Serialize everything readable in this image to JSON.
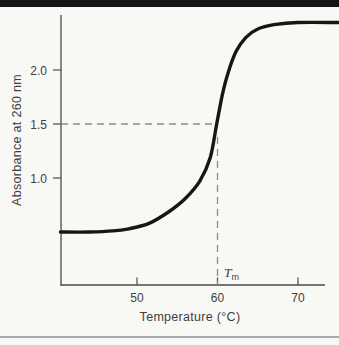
{
  "colors": {
    "background": "#f8f8f5",
    "top_bar": "#141414",
    "bottom_rule": "#a9a9a9",
    "axis": "#4a4a4a",
    "text": "#3f3f3f",
    "guide": "#8c8c8c",
    "curve": "#161616"
  },
  "labels": {
    "y_axis": "Absorbance at 260 nm",
    "x_axis": "Temperature (°C)",
    "tm_main": "T",
    "tm_sub": "m"
  },
  "chart_data": {
    "type": "line",
    "title": "",
    "xlabel": "Temperature (°C)",
    "ylabel": "Absorbance at 260 nm",
    "xlim": [
      40.5,
      73.5
    ],
    "ylim": [
      0,
      2.5
    ],
    "grid": false,
    "legend": null,
    "x_ticks": [
      50,
      60,
      70
    ],
    "x_tick_labels": [
      "50",
      "60",
      "70"
    ],
    "y_ticks": [
      1.0,
      1.5,
      2.0
    ],
    "y_tick_labels": [
      "1.0",
      "1.5",
      "2.0"
    ],
    "series": [
      {
        "name": "absorbance-melting-curve",
        "x": [
          40.5,
          44.0,
          47.0,
          49.0,
          51.5,
          54.0,
          56.0,
          57.8,
          59.1,
          59.9,
          60.6,
          61.3,
          62.3,
          63.5,
          65.0,
          67.0,
          70.0,
          75.0
        ],
        "y": [
          0.5,
          0.5,
          0.51,
          0.53,
          0.58,
          0.69,
          0.81,
          0.97,
          1.19,
          1.5,
          1.77,
          1.97,
          2.17,
          2.3,
          2.38,
          2.42,
          2.44,
          2.44
        ]
      }
    ],
    "tm_guide": {
      "temperature": 60,
      "absorbance": 1.5,
      "label": "Tm"
    }
  }
}
